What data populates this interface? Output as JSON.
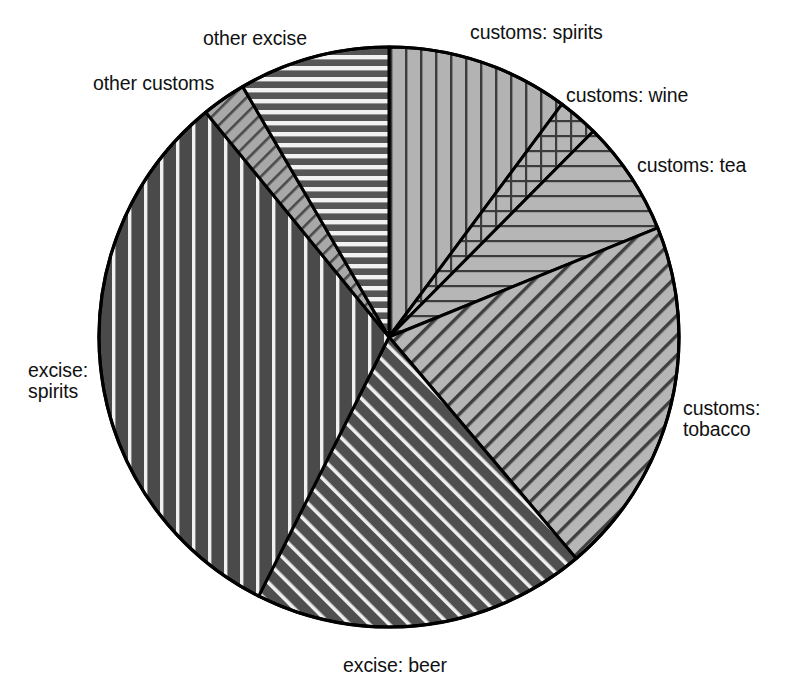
{
  "chart_data": {
    "type": "pie",
    "title": "",
    "subtitle": "",
    "xlabel": "",
    "ylabel": "",
    "legend_position": "none",
    "grid": false,
    "labels_on_slices": false,
    "center": {
      "x": 389,
      "y": 337
    },
    "radius": 290,
    "start_angle_deg": 0,
    "direction": "clockwise",
    "categories": [
      "customs: spirits",
      "customs: wine",
      "customs: tea",
      "customs: tobacco",
      "excise: beer",
      "excise: spirits",
      "other customs",
      "other excise"
    ],
    "values": [
      10.2,
      2.3,
      6.4,
      20.0,
      18.6,
      31.7,
      2.5,
      8.4
    ],
    "units": "percent",
    "slices": [
      {
        "label": "customs: spirits",
        "value": 10.2,
        "start_deg": 0.0,
        "end_deg": 36.6,
        "fill": "vertical-lines",
        "fill_color": "#b0b0b0",
        "hatch_color": "#3a3a3a",
        "label_pos": "outside-top-right"
      },
      {
        "label": "customs: wine",
        "value": 2.3,
        "start_deg": 36.6,
        "end_deg": 44.8,
        "fill": "cross-hatch-grid",
        "fill_color": "#b4b4b4",
        "hatch_color": "#3a3a3a",
        "label_pos": "outside-right"
      },
      {
        "label": "customs: tea",
        "value": 6.4,
        "start_deg": 44.8,
        "end_deg": 67.9,
        "fill": "horizontal-lines",
        "fill_color": "#b4b4b4",
        "hatch_color": "#3a3a3a",
        "label_pos": "outside-right"
      },
      {
        "label": "customs: tobacco",
        "value": 20.0,
        "start_deg": 67.9,
        "end_deg": 139.8,
        "fill": "diagonal-lines-down",
        "fill_color": "#b4b4b4",
        "hatch_color": "#3a3a3a",
        "label_pos": "outside-right"
      },
      {
        "label": "excise: beer",
        "value": 18.6,
        "start_deg": 139.8,
        "end_deg": 206.7,
        "fill": "diagonal-lines-up-dark",
        "fill_color": "#555555",
        "hatch_color": "#f0f0f0",
        "label_pos": "outside-bottom"
      },
      {
        "label": "excise: spirits",
        "value": 31.7,
        "start_deg": 206.7,
        "end_deg": 320.8,
        "fill": "vertical-lines-dark",
        "fill_color": "#4e4e4e",
        "hatch_color": "#f0f0f0",
        "label_pos": "outside-left"
      },
      {
        "label": "other customs",
        "value": 2.5,
        "start_deg": 320.8,
        "end_deg": 329.7,
        "fill": "diagonal-lines-down-light",
        "fill_color": "#aaaaaa",
        "hatch_color": "#4a4a4a",
        "label_pos": "outside-top-left"
      },
      {
        "label": "other excise",
        "value": 8.4,
        "start_deg": 329.7,
        "end_deg": 360.0,
        "fill": "horizontal-lines-dark",
        "fill_color": "#5a5a5a",
        "hatch_color": "#f2f2f2",
        "label_pos": "outside-top"
      }
    ],
    "outline_color": "#000000",
    "outline_width": 3,
    "background": "#ffffff"
  },
  "labels": {
    "customs_spirits": "customs: spirits",
    "customs_wine": "customs: wine",
    "customs_tea": "customs: tea",
    "customs_tobacco_line1": "customs:",
    "customs_tobacco_line2": "tobacco",
    "excise_beer": "excise: beer",
    "excise_spirits_line1": "excise:",
    "excise_spirits_line2": "spirits",
    "other_customs": "other customs",
    "other_excise": "other excise"
  }
}
